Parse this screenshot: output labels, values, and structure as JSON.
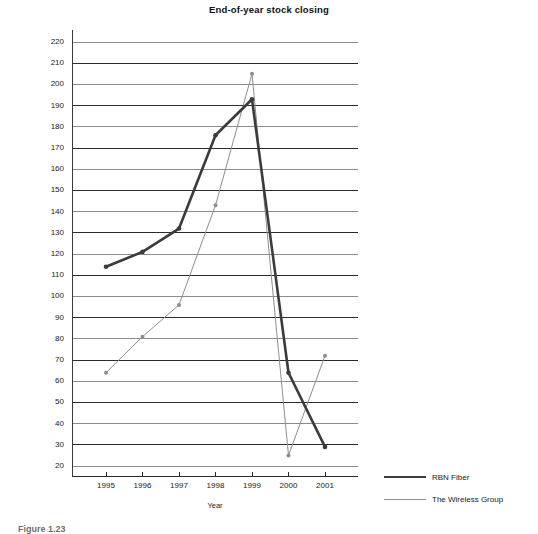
{
  "chart_data": {
    "type": "line",
    "title": "End-of-year stock closing",
    "xlabel": "Year",
    "ylabel": "Price per share ($)",
    "categories": [
      "1995",
      "1996",
      "1997",
      "1998",
      "1999",
      "2000",
      "2001"
    ],
    "x": [
      1995,
      1996,
      1997,
      1998,
      1999,
      2000,
      2001
    ],
    "ylim": [
      10,
      230
    ],
    "yticks": [
      220,
      210,
      200,
      190,
      180,
      170,
      160,
      150,
      140,
      130,
      120,
      110,
      100,
      90,
      80,
      70,
      60,
      50,
      40,
      30,
      20
    ],
    "grid": true,
    "legend_position": "right-bottom",
    "series": [
      {
        "name": "RBN Fiber",
        "values": [
          114,
          121,
          132,
          176,
          193,
          64,
          29
        ],
        "color": "#3b3b3b",
        "line_width": 2.6,
        "marker": true
      },
      {
        "name": "The Wireless Group",
        "values": [
          64,
          81,
          96,
          143,
          205,
          25,
          72
        ],
        "color": "#8d8d8d",
        "line_width": 1.0,
        "marker": true
      }
    ]
  },
  "figure": {
    "caption": "Figure 1.23"
  }
}
